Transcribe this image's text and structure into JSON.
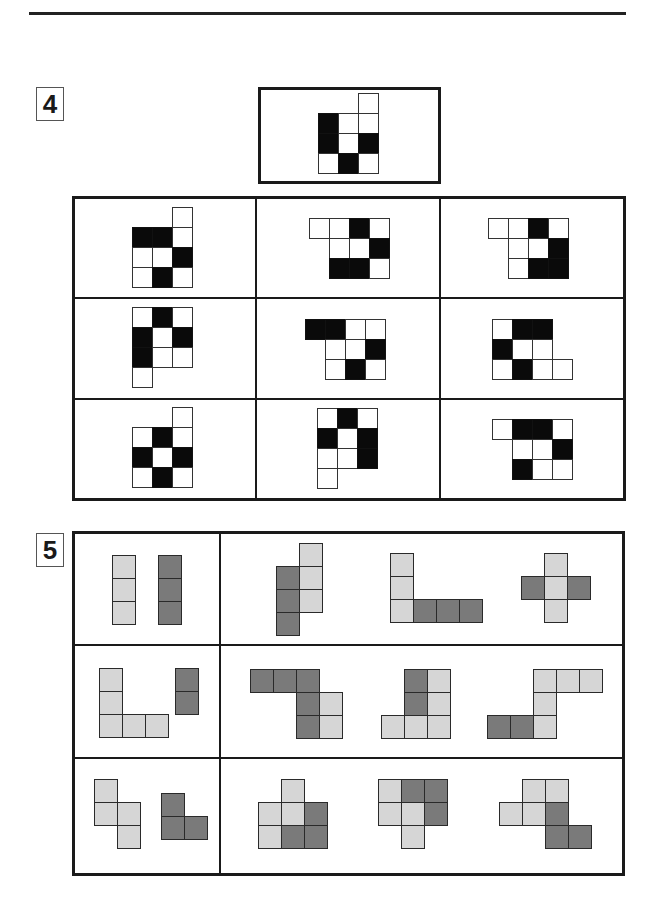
{
  "page": {
    "top_rule": true
  },
  "question4": {
    "number": "4",
    "cell_size": 20,
    "colors": {
      "w": "#ffffff",
      "b": "#0a0a0a"
    },
    "reference": {
      "origin": [
        318,
        93
      ],
      "cells": [
        [
          0,
          2,
          "w"
        ],
        [
          1,
          0,
          "b"
        ],
        [
          1,
          1,
          "w"
        ],
        [
          1,
          2,
          "w"
        ],
        [
          2,
          0,
          "b"
        ],
        [
          2,
          1,
          "w"
        ],
        [
          2,
          2,
          "b"
        ],
        [
          3,
          0,
          "w"
        ],
        [
          3,
          1,
          "b"
        ],
        [
          3,
          2,
          "w"
        ]
      ]
    },
    "options": [
      {
        "label": "A1",
        "origin": [
          132,
          207
        ],
        "cells": [
          [
            0,
            2,
            "w"
          ],
          [
            1,
            0,
            "b"
          ],
          [
            1,
            1,
            "b"
          ],
          [
            1,
            2,
            "w"
          ],
          [
            2,
            0,
            "w"
          ],
          [
            2,
            1,
            "w"
          ],
          [
            2,
            2,
            "b"
          ],
          [
            3,
            0,
            "w"
          ],
          [
            3,
            1,
            "b"
          ],
          [
            3,
            2,
            "w"
          ]
        ]
      },
      {
        "label": "A2",
        "origin": [
          309,
          218
        ],
        "cells": [
          [
            0,
            0,
            "w"
          ],
          [
            0,
            1,
            "w"
          ],
          [
            0,
            2,
            "b"
          ],
          [
            0,
            3,
            "w"
          ],
          [
            1,
            1,
            "w"
          ],
          [
            1,
            2,
            "w"
          ],
          [
            1,
            3,
            "b"
          ],
          [
            2,
            1,
            "b"
          ],
          [
            2,
            2,
            "b"
          ],
          [
            2,
            3,
            "w"
          ]
        ]
      },
      {
        "label": "A3",
        "origin": [
          488,
          218
        ],
        "cells": [
          [
            0,
            0,
            "w"
          ],
          [
            0,
            1,
            "w"
          ],
          [
            0,
            2,
            "b"
          ],
          [
            0,
            3,
            "w"
          ],
          [
            1,
            1,
            "w"
          ],
          [
            1,
            2,
            "w"
          ],
          [
            1,
            3,
            "b"
          ],
          [
            2,
            1,
            "w"
          ],
          [
            2,
            2,
            "b"
          ],
          [
            2,
            3,
            "b"
          ]
        ]
      },
      {
        "label": "B1",
        "origin": [
          132,
          307
        ],
        "cells": [
          [
            0,
            0,
            "w"
          ],
          [
            0,
            1,
            "b"
          ],
          [
            0,
            2,
            "w"
          ],
          [
            1,
            0,
            "b"
          ],
          [
            1,
            1,
            "w"
          ],
          [
            1,
            2,
            "b"
          ],
          [
            2,
            0,
            "b"
          ],
          [
            2,
            1,
            "w"
          ],
          [
            2,
            2,
            "w"
          ],
          [
            3,
            0,
            "w"
          ]
        ]
      },
      {
        "label": "B2",
        "origin": [
          305,
          319
        ],
        "cells": [
          [
            0,
            0,
            "b"
          ],
          [
            0,
            1,
            "b"
          ],
          [
            0,
            2,
            "w"
          ],
          [
            0,
            3,
            "w"
          ],
          [
            1,
            1,
            "w"
          ],
          [
            1,
            2,
            "w"
          ],
          [
            1,
            3,
            "b"
          ],
          [
            2,
            1,
            "w"
          ],
          [
            2,
            2,
            "b"
          ],
          [
            2,
            3,
            "w"
          ]
        ]
      },
      {
        "label": "B3",
        "origin": [
          492,
          319
        ],
        "cells": [
          [
            0,
            0,
            "w"
          ],
          [
            0,
            1,
            "b"
          ],
          [
            0,
            2,
            "b"
          ],
          [
            1,
            0,
            "b"
          ],
          [
            1,
            1,
            "w"
          ],
          [
            1,
            2,
            "w"
          ],
          [
            2,
            0,
            "w"
          ],
          [
            2,
            1,
            "b"
          ],
          [
            2,
            2,
            "w"
          ],
          [
            2,
            3,
            "w"
          ]
        ]
      },
      {
        "label": "C1",
        "origin": [
          132,
          407
        ],
        "cells": [
          [
            0,
            2,
            "w"
          ],
          [
            1,
            0,
            "w"
          ],
          [
            1,
            1,
            "b"
          ],
          [
            1,
            2,
            "w"
          ],
          [
            2,
            0,
            "b"
          ],
          [
            2,
            1,
            "w"
          ],
          [
            2,
            2,
            "b"
          ],
          [
            3,
            0,
            "w"
          ],
          [
            3,
            1,
            "b"
          ],
          [
            3,
            2,
            "w"
          ]
        ]
      },
      {
        "label": "C2",
        "origin": [
          317,
          408
        ],
        "cells": [
          [
            0,
            0,
            "w"
          ],
          [
            0,
            1,
            "b"
          ],
          [
            0,
            2,
            "w"
          ],
          [
            1,
            0,
            "b"
          ],
          [
            1,
            1,
            "w"
          ],
          [
            1,
            2,
            "b"
          ],
          [
            2,
            0,
            "w"
          ],
          [
            2,
            1,
            "w"
          ],
          [
            2,
            2,
            "b"
          ],
          [
            3,
            0,
            "w"
          ]
        ]
      },
      {
        "label": "C3",
        "origin": [
          492,
          419
        ],
        "cells": [
          [
            0,
            0,
            "w"
          ],
          [
            0,
            1,
            "b"
          ],
          [
            0,
            2,
            "b"
          ],
          [
            0,
            3,
            "w"
          ],
          [
            1,
            1,
            "w"
          ],
          [
            1,
            2,
            "w"
          ],
          [
            1,
            3,
            "b"
          ],
          [
            2,
            1,
            "b"
          ],
          [
            2,
            2,
            "w"
          ],
          [
            2,
            3,
            "w"
          ]
        ]
      }
    ]
  },
  "question5": {
    "number": "5",
    "cell_size": 23,
    "colors": {
      "l": "#d6d6d6",
      "d": "#7a7a7a"
    },
    "figures": [
      {
        "label": "R1-example",
        "origin": [
          112,
          555
        ],
        "cells": [
          [
            0,
            0,
            "l"
          ],
          [
            1,
            0,
            "l"
          ],
          [
            2,
            0,
            "l"
          ],
          [
            0,
            2,
            "d"
          ],
          [
            1,
            2,
            "d"
          ],
          [
            2,
            2,
            "d"
          ]
        ]
      },
      {
        "label": "R1-opt1",
        "origin": [
          276,
          543
        ],
        "cells": [
          [
            0,
            1,
            "l"
          ],
          [
            1,
            1,
            "l"
          ],
          [
            2,
            1,
            "l"
          ],
          [
            1,
            0,
            "d"
          ],
          [
            2,
            0,
            "d"
          ],
          [
            3,
            0,
            "d"
          ]
        ]
      },
      {
        "label": "R1-opt2",
        "origin": [
          390,
          553
        ],
        "cells": [
          [
            0,
            0,
            "l"
          ],
          [
            1,
            0,
            "l"
          ],
          [
            2,
            0,
            "l"
          ],
          [
            2,
            1,
            "d"
          ],
          [
            2,
            2,
            "d"
          ],
          [
            2,
            3,
            "d"
          ]
        ]
      },
      {
        "label": "R1-opt3",
        "origin": [
          521,
          553
        ],
        "cells": [
          [
            0,
            1,
            "l"
          ],
          [
            1,
            1,
            "l"
          ],
          [
            2,
            1,
            "l"
          ],
          [
            1,
            0,
            "d"
          ],
          [
            1,
            2,
            "d"
          ]
        ]
      },
      {
        "label": "R2-example",
        "origin": [
          99,
          668
        ],
        "cells": [
          [
            0,
            0,
            "l"
          ],
          [
            1,
            0,
            "l"
          ],
          [
            2,
            0,
            "l"
          ],
          [
            2,
            1,
            "l"
          ],
          [
            2,
            2,
            "l"
          ],
          [
            0,
            3.3,
            "d"
          ],
          [
            1,
            3.3,
            "d"
          ]
        ]
      },
      {
        "label": "R2-opt1",
        "origin": [
          250,
          669
        ],
        "cells": [
          [
            0,
            0,
            "d"
          ],
          [
            0,
            1,
            "d"
          ],
          [
            0,
            2,
            "d"
          ],
          [
            1,
            2,
            "d"
          ],
          [
            2,
            2,
            "d"
          ],
          [
            1,
            3,
            "l"
          ],
          [
            2,
            3,
            "l"
          ]
        ]
      },
      {
        "label": "R2-opt2",
        "origin": [
          381,
          669
        ],
        "cells": [
          [
            0,
            1,
            "d"
          ],
          [
            1,
            1,
            "d"
          ],
          [
            0,
            2,
            "l"
          ],
          [
            1,
            2,
            "l"
          ],
          [
            2,
            0,
            "l"
          ],
          [
            2,
            1,
            "l"
          ],
          [
            2,
            2,
            "l"
          ]
        ]
      },
      {
        "label": "R2-opt3",
        "origin": [
          487,
          669
        ],
        "cells": [
          [
            0,
            2,
            "l"
          ],
          [
            0,
            3,
            "l"
          ],
          [
            0,
            4,
            "l"
          ],
          [
            1,
            2,
            "l"
          ],
          [
            2,
            2,
            "l"
          ],
          [
            2,
            0,
            "d"
          ],
          [
            2,
            1,
            "d"
          ]
        ]
      },
      {
        "label": "R3-example",
        "origin": [
          94,
          779
        ],
        "cells": [
          [
            0,
            0,
            "l"
          ],
          [
            1,
            0,
            "l"
          ],
          [
            1,
            1,
            "l"
          ],
          [
            2,
            1,
            "l"
          ],
          [
            0.6,
            2.9,
            "d"
          ],
          [
            1.6,
            2.9,
            "d"
          ],
          [
            1.6,
            3.9,
            "d"
          ]
        ]
      },
      {
        "label": "R3-opt1",
        "origin": [
          258,
          779
        ],
        "cells": [
          [
            0,
            1,
            "l"
          ],
          [
            1,
            0,
            "l"
          ],
          [
            1,
            1,
            "l"
          ],
          [
            1,
            2,
            "d"
          ],
          [
            2,
            0,
            "l"
          ],
          [
            2,
            1,
            "d"
          ],
          [
            2,
            2,
            "d"
          ]
        ]
      },
      {
        "label": "R3-opt2",
        "origin": [
          378,
          779
        ],
        "cells": [
          [
            0,
            0,
            "l"
          ],
          [
            0,
            1,
            "d"
          ],
          [
            0,
            2,
            "d"
          ],
          [
            1,
            0,
            "l"
          ],
          [
            1,
            1,
            "l"
          ],
          [
            1,
            2,
            "d"
          ],
          [
            2,
            1,
            "l"
          ]
        ]
      },
      {
        "label": "R3-opt3",
        "origin": [
          499,
          779
        ],
        "cells": [
          [
            0,
            1,
            "l"
          ],
          [
            0,
            2,
            "l"
          ],
          [
            1,
            0,
            "l"
          ],
          [
            1,
            1,
            "l"
          ],
          [
            1,
            2,
            "d"
          ],
          [
            2,
            2,
            "d"
          ],
          [
            2,
            3,
            "d"
          ]
        ]
      }
    ]
  }
}
